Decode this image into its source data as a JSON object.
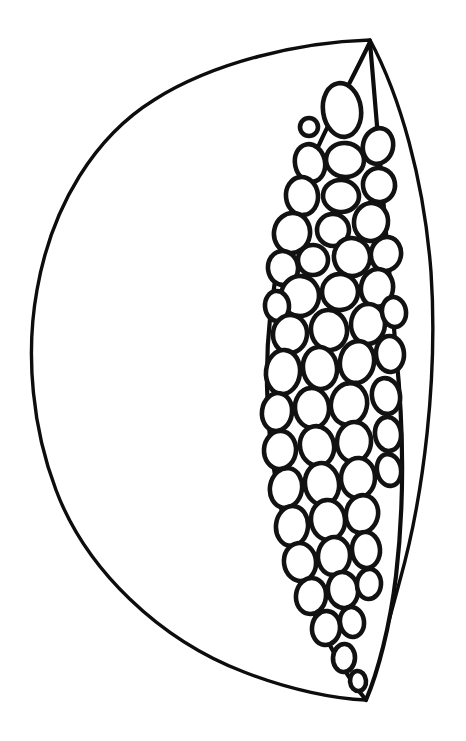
{
  "illustration": {
    "title": "Halved fruit line drawing",
    "subject_name": "cocoa-pod-half",
    "style": "coloring-book line art",
    "background_color": "#ffffff",
    "line_color": "#0d0d0d",
    "canvas": {
      "width": 466,
      "height": 741
    },
    "parts": {
      "outer_rind": {
        "name": "outer rind crescent",
        "stroke_width": 3.4,
        "fill": "#ffffff",
        "description": "large leaf-shaped outline sweeping from top apex left and down to bottom apex"
      },
      "right_rind_edge": {
        "name": "right rind edge",
        "stroke_width": 3.4,
        "fill": "none",
        "description": "bowed vertical line on the right joining the two apex points"
      },
      "seed_cavity": {
        "name": "seed cavity",
        "stroke_width": 4.2,
        "fill": "#ffffff",
        "description": "narrow lens-shaped pocket holding the seeds"
      },
      "seeds": {
        "name": "seeds",
        "count": 86,
        "stroke_width": 4.6,
        "fill": "#ffffff",
        "description": "rounded irregular ellipses packed tightly inside the cavity"
      }
    },
    "geometry": {
      "top_apex": {
        "x": 370,
        "y": 40
      },
      "bottom_apex": {
        "x": 366,
        "y": 700
      },
      "left_extent": {
        "x": 33,
        "y": 372
      },
      "right_extent": {
        "x": 433,
        "y": 368
      }
    }
  },
  "paths": {
    "outer_rind": "M 370 40 C 300 42 214 62 154 100 C 96 136 52 204 37 290 C 25 356 33 430 56 490 C 86 570 160 640 244 672 C 290 690 336 699 366 700 L 370 40 Z",
    "right_rind_edge": "M 370 40 C 400 96 424 180 431 272 C 438 376 424 494 400 580 C 386 632 374 676 366 700",
    "seed_cavity": "M 370 42 C 348 88 316 144 296 200 C 276 258 266 322 267 386 C 268 456 282 528 304 588 C 322 638 348 678 366 700 C 378 672 390 626 396 576 C 404 508 404 430 396 352 C 388 268 380 160 370 42 Z"
  },
  "chart_data": {
    "type": "scatter",
    "xlabel": "x (px)",
    "ylabel": "y (px)",
    "xlim": [
      260,
      410
    ],
    "ylim": [
      40,
      710
    ],
    "grid": false,
    "legend": "none",
    "series": [
      {
        "name": "seeds",
        "points": [
          {
            "cx": 342,
            "cy": 110,
            "rx": 19,
            "ry": 27,
            "rot": -8
          },
          {
            "cx": 309,
            "cy": 127,
            "rx": 9,
            "ry": 9,
            "rot": 0
          },
          {
            "cx": 345,
            "cy": 160,
            "rx": 19,
            "ry": 17,
            "rot": 6
          },
          {
            "cx": 310,
            "cy": 163,
            "rx": 15,
            "ry": 19,
            "rot": -12
          },
          {
            "cx": 378,
            "cy": 146,
            "rx": 15,
            "ry": 18,
            "rot": 14
          },
          {
            "cx": 302,
            "cy": 196,
            "rx": 16,
            "ry": 19,
            "rot": -6
          },
          {
            "cx": 341,
            "cy": 196,
            "rx": 18,
            "ry": 16,
            "rot": 4
          },
          {
            "cx": 379,
            "cy": 185,
            "rx": 16,
            "ry": 17,
            "rot": -10
          },
          {
            "cx": 292,
            "cy": 233,
            "rx": 18,
            "ry": 20,
            "rot": 10
          },
          {
            "cx": 333,
            "cy": 230,
            "rx": 16,
            "ry": 16,
            "rot": -4
          },
          {
            "cx": 371,
            "cy": 222,
            "rx": 17,
            "ry": 19,
            "rot": 8
          },
          {
            "cx": 352,
            "cy": 257,
            "rx": 18,
            "ry": 19,
            "rot": -14
          },
          {
            "cx": 313,
            "cy": 260,
            "rx": 15,
            "ry": 15,
            "rot": 2
          },
          {
            "cx": 283,
            "cy": 268,
            "rx": 15,
            "ry": 17,
            "rot": -8
          },
          {
            "cx": 386,
            "cy": 254,
            "rx": 15,
            "ry": 17,
            "rot": 12
          },
          {
            "cx": 300,
            "cy": 296,
            "rx": 19,
            "ry": 20,
            "rot": 6
          },
          {
            "cx": 340,
            "cy": 292,
            "rx": 18,
            "ry": 18,
            "rot": -6
          },
          {
            "cx": 377,
            "cy": 288,
            "rx": 16,
            "ry": 19,
            "rot": 10
          },
          {
            "cx": 277,
            "cy": 306,
            "rx": 12,
            "ry": 15,
            "rot": -4
          },
          {
            "cx": 290,
            "cy": 334,
            "rx": 17,
            "ry": 19,
            "rot": 8
          },
          {
            "cx": 329,
            "cy": 330,
            "rx": 18,
            "ry": 20,
            "rot": -10
          },
          {
            "cx": 368,
            "cy": 324,
            "rx": 17,
            "ry": 20,
            "rot": 4
          },
          {
            "cx": 394,
            "cy": 312,
            "rx": 12,
            "ry": 15,
            "rot": -8
          },
          {
            "cx": 283,
            "cy": 372,
            "rx": 17,
            "ry": 22,
            "rot": 6
          },
          {
            "cx": 320,
            "cy": 368,
            "rx": 17,
            "ry": 21,
            "rot": -8
          },
          {
            "cx": 357,
            "cy": 362,
            "rx": 17,
            "ry": 21,
            "rot": 10
          },
          {
            "cx": 390,
            "cy": 354,
            "rx": 14,
            "ry": 18,
            "rot": -4
          },
          {
            "cx": 277,
            "cy": 412,
            "rx": 15,
            "ry": 19,
            "rot": 8
          },
          {
            "cx": 312,
            "cy": 408,
            "rx": 17,
            "ry": 20,
            "rot": -6
          },
          {
            "cx": 349,
            "cy": 404,
            "rx": 18,
            "ry": 21,
            "rot": 12
          },
          {
            "cx": 386,
            "cy": 396,
            "rx": 14,
            "ry": 18,
            "rot": -10
          },
          {
            "cx": 280,
            "cy": 450,
            "rx": 16,
            "ry": 19,
            "rot": 4
          },
          {
            "cx": 317,
            "cy": 446,
            "rx": 17,
            "ry": 20,
            "rot": -12
          },
          {
            "cx": 354,
            "cy": 442,
            "rx": 17,
            "ry": 20,
            "rot": 6
          },
          {
            "cx": 388,
            "cy": 434,
            "rx": 13,
            "ry": 17,
            "rot": -6
          },
          {
            "cx": 286,
            "cy": 488,
            "rx": 16,
            "ry": 20,
            "rot": 10
          },
          {
            "cx": 322,
            "cy": 484,
            "rx": 17,
            "ry": 21,
            "rot": -8
          },
          {
            "cx": 358,
            "cy": 478,
            "rx": 17,
            "ry": 20,
            "rot": 4
          },
          {
            "cx": 389,
            "cy": 470,
            "rx": 12,
            "ry": 16,
            "rot": -10
          },
          {
            "cx": 292,
            "cy": 526,
            "rx": 16,
            "ry": 20,
            "rot": 6
          },
          {
            "cx": 328,
            "cy": 520,
            "rx": 17,
            "ry": 20,
            "rot": -6
          },
          {
            "cx": 362,
            "cy": 514,
            "rx": 16,
            "ry": 19,
            "rot": 12
          },
          {
            "cx": 300,
            "cy": 562,
            "rx": 16,
            "ry": 19,
            "rot": -8
          },
          {
            "cx": 334,
            "cy": 556,
            "rx": 16,
            "ry": 19,
            "rot": 6
          },
          {
            "cx": 366,
            "cy": 550,
            "rx": 14,
            "ry": 18,
            "rot": -4
          },
          {
            "cx": 311,
            "cy": 596,
            "rx": 15,
            "ry": 18,
            "rot": 8
          },
          {
            "cx": 343,
            "cy": 590,
            "rx": 15,
            "ry": 18,
            "rot": -10
          },
          {
            "cx": 369,
            "cy": 584,
            "rx": 12,
            "ry": 15,
            "rot": 4
          },
          {
            "cx": 326,
            "cy": 628,
            "rx": 14,
            "ry": 17,
            "rot": 6
          },
          {
            "cx": 352,
            "cy": 622,
            "rx": 12,
            "ry": 15,
            "rot": -8
          },
          {
            "cx": 344,
            "cy": 658,
            "rx": 11,
            "ry": 14,
            "rot": 4
          },
          {
            "cx": 358,
            "cy": 681,
            "rx": 8,
            "ry": 10,
            "rot": -6
          }
        ]
      }
    ]
  }
}
